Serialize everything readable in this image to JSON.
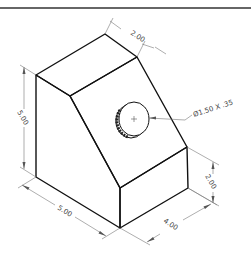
{
  "drawing": {
    "type": "isometric-view",
    "dimensions": {
      "top_depth": "2.00",
      "left_height": "5.00",
      "front_width": "5.00",
      "right_height": "2.00",
      "right_depth": "4.00",
      "hole_callout": "Ø1.50 X .35"
    },
    "colors": {
      "object_line": "#111111",
      "dimension_line": "#777777",
      "background": "#ffffff"
    }
  }
}
